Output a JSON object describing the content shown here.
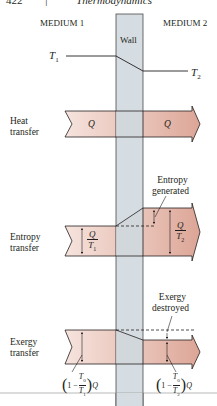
{
  "header": {
    "page_number": "422",
    "separator": "|",
    "book_title": "Thermodynamics"
  },
  "regions": {
    "medium1": "MEDIUM 1",
    "medium2": "MEDIUM 2",
    "wall": "Wall"
  },
  "temperature_profile": {
    "t1_label": "T",
    "t1_sub": "1",
    "t2_label": "T",
    "t2_sub": "2"
  },
  "rows": [
    {
      "label_line1": "Heat",
      "label_line2": "transfer",
      "left_value": "Q",
      "right_value": "Q"
    },
    {
      "label_line1": "Entropy",
      "label_line2": "transfer",
      "left_value_num": "Q",
      "left_value_den": "T",
      "left_value_den_sub": "1",
      "right_value_num": "Q",
      "right_value_den": "T",
      "right_value_den_sub": "2",
      "annotation_line1": "Entropy",
      "annotation_line2": "generated"
    },
    {
      "label_line1": "Exergy",
      "label_line2": "transfer",
      "left_expr_prefix": "1 −",
      "left_expr_num": "T",
      "left_expr_num_sub": "0",
      "left_expr_den": "T",
      "left_expr_den_sub": "1",
      "left_expr_suffix": "Q",
      "right_expr_prefix": "1 −",
      "right_expr_num": "T",
      "right_expr_num_sub": "0",
      "right_expr_den": "T",
      "right_expr_den_sub": "2",
      "right_expr_suffix": "Q",
      "annotation_line1": "Exergy",
      "annotation_line2": "destroyed"
    }
  ],
  "colors": {
    "wall_fill": "#d6dde2",
    "wall_stroke": "#4a4a4a",
    "arrow_left_fill": "#f3ddd6",
    "arrow_right_fill": "#e2b4a8",
    "line": "#231f20"
  }
}
